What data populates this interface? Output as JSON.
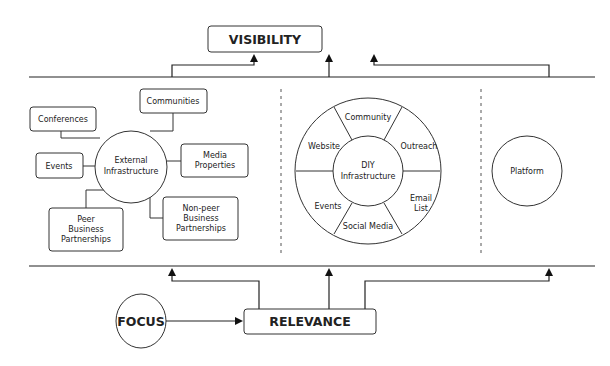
{
  "diagram": {
    "visibility": "VISIBILITY",
    "relevance": "RELEVANCE",
    "focus": "FOCUS",
    "external": {
      "center_line1": "External",
      "center_line2": "Infrastructure",
      "conferences": "Conferences",
      "communities": "Communities",
      "events": "Events",
      "media_line1": "Media",
      "media_line2": "Properties",
      "peer_line1": "Peer",
      "peer_line2": "Business",
      "peer_line3": "Partnerships",
      "nonpeer_line1": "Non-peer",
      "nonpeer_line2": "Business",
      "nonpeer_line3": "Partnerships"
    },
    "diy": {
      "center_line1": "DIY",
      "center_line2": "Infrastructure",
      "community": "Community",
      "outreach": "Outreach",
      "email_line1": "Email",
      "email_line2": "List",
      "social_media": "Social Media",
      "events": "Events",
      "website": "Website"
    },
    "platform": "Platform"
  }
}
